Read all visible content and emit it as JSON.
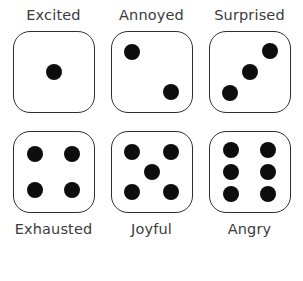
{
  "page": {
    "background_color": "#ffffff",
    "label_color": "#3b3b3b",
    "die_border_color": "#2e2e2e",
    "die_face_color": "#ffffff",
    "pip_color": "#0d0d0d",
    "rows": 2,
    "columns": 3
  },
  "dice": [
    {
      "label": "Excited",
      "value": 1,
      "label_position": "above",
      "pips": [
        {
          "x": 50,
          "y": 50
        }
      ]
    },
    {
      "label": "Annoyed",
      "value": 2,
      "label_position": "above",
      "pips": [
        {
          "x": 26,
          "y": 25
        },
        {
          "x": 74,
          "y": 75
        }
      ]
    },
    {
      "label": "Surprised",
      "value": 3,
      "label_position": "above",
      "pips": [
        {
          "x": 75,
          "y": 24
        },
        {
          "x": 50,
          "y": 50
        },
        {
          "x": 25,
          "y": 76
        }
      ]
    },
    {
      "label": "Exhausted",
      "value": 4,
      "label_position": "below",
      "pips": [
        {
          "x": 27,
          "y": 27
        },
        {
          "x": 73,
          "y": 27
        },
        {
          "x": 27,
          "y": 73
        },
        {
          "x": 73,
          "y": 73
        }
      ]
    },
    {
      "label": "Joyful",
      "value": 5,
      "label_position": "below",
      "pips": [
        {
          "x": 26,
          "y": 25
        },
        {
          "x": 74,
          "y": 25
        },
        {
          "x": 50,
          "y": 50
        },
        {
          "x": 26,
          "y": 75
        },
        {
          "x": 74,
          "y": 75
        }
      ]
    },
    {
      "label": "Angry",
      "value": 6,
      "label_position": "below",
      "pips": [
        {
          "x": 27,
          "y": 22
        },
        {
          "x": 73,
          "y": 22
        },
        {
          "x": 27,
          "y": 50
        },
        {
          "x": 73,
          "y": 50
        },
        {
          "x": 27,
          "y": 78
        },
        {
          "x": 73,
          "y": 78
        }
      ]
    }
  ]
}
